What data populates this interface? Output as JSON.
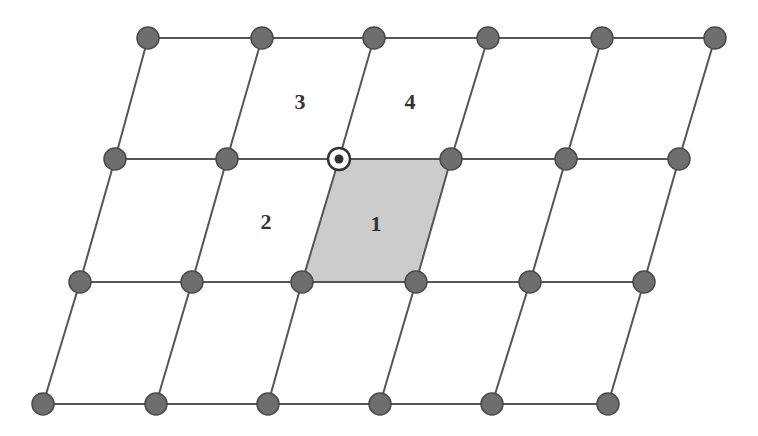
{
  "diagram": {
    "type": "skewed-lattice-grid",
    "colors": {
      "line": "#555555",
      "node_fill": "#6e6e6e",
      "node_stroke": "#4a4a4a",
      "highlight_cell": "#cccccc",
      "special_node_ring": "#333333",
      "special_node_dot": "#333333",
      "label": "#333333"
    },
    "rows": [
      {
        "y": 38,
        "xs": [
          148,
          262,
          374,
          488,
          602,
          715
        ]
      },
      {
        "y": 159,
        "xs": [
          115,
          227,
          339,
          451,
          566,
          679
        ]
      },
      {
        "y": 282,
        "xs": [
          80,
          192,
          302,
          416,
          530,
          644
        ]
      },
      {
        "y": 404,
        "xs": [
          43,
          156,
          268,
          380,
          492,
          608
        ]
      }
    ],
    "special_node": {
      "row": 1,
      "col": 2
    },
    "highlighted_cell": {
      "row": 1,
      "col": 2
    },
    "cell_labels": [
      {
        "text": "3",
        "x": 300,
        "y": 102
      },
      {
        "text": "4",
        "x": 410,
        "y": 102
      },
      {
        "text": "2",
        "x": 266,
        "y": 222
      },
      {
        "text": "1",
        "x": 376,
        "y": 224
      }
    ]
  }
}
